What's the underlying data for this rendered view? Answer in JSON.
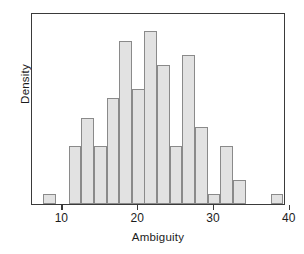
{
  "chart_data": {
    "type": "bar",
    "title": "",
    "subtitle": "",
    "xlabel": "Ambiguity",
    "ylabel": "Density",
    "grid": false,
    "legend": null,
    "xlim": [
      6.0,
      39.5
    ],
    "ylim": [
      0,
      0.125
    ],
    "xticks": [
      10,
      20,
      30,
      40
    ],
    "xtick_labels": [
      "10",
      "20",
      "30",
      "40"
    ],
    "yticks": [],
    "ytick_labels": [],
    "bin_width": 1.67,
    "bin_left_edges": [
      7.5,
      9.17,
      10.83,
      12.5,
      14.17,
      15.83,
      17.5,
      19.17,
      20.83,
      22.5,
      24.17,
      25.83,
      27.5,
      29.17,
      30.83,
      32.5,
      34.17,
      35.83,
      37.5
    ],
    "bin_centers": [
      8.33,
      10.0,
      11.67,
      13.33,
      15.0,
      16.67,
      18.33,
      20.0,
      21.67,
      23.33,
      25.0,
      26.67,
      28.33,
      30.0,
      31.67,
      33.33,
      35.0,
      36.67,
      38.33
    ],
    "categories": [
      "8.3",
      "10.0",
      "11.7",
      "13.3",
      "15.0",
      "16.7",
      "18.3",
      "20.0",
      "21.7",
      "23.3",
      "25.0",
      "26.7",
      "28.3",
      "30.0",
      "31.7",
      "33.3",
      "35.0",
      "36.7",
      "38.3"
    ],
    "values": [
      0.0063,
      0,
      0.0375,
      0.0563,
      0.0375,
      0.0688,
      0.1063,
      0.075,
      0.1125,
      0.0906,
      0.0375,
      0.0969,
      0.05,
      0.0063,
      0.0375,
      0.0156,
      0,
      0,
      0.0063
    ],
    "bar_fill_color": "#e2e2e2",
    "bar_edge_color": "#8a8a8a",
    "frame_color": "#3a3a3a",
    "background_color": "#ffffff"
  }
}
